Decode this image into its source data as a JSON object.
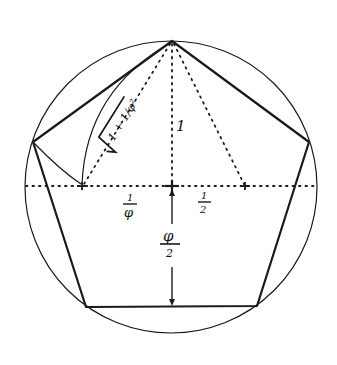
{
  "diagram": {
    "stroke_color": "#1a1a1a",
    "background": "#ffffff",
    "circle": {
      "cx": 171,
      "cy": 187,
      "r": 146
    },
    "pentagon": {
      "vertices": [
        [
          172,
          41
        ],
        [
          309,
          142
        ],
        [
          257,
          306
        ],
        [
          86,
          307
        ],
        [
          33,
          142
        ]
      ]
    },
    "baseline_y": 186,
    "markers": [
      {
        "name": "left-point",
        "x": 82,
        "y": 186
      },
      {
        "name": "center-point",
        "x": 172,
        "y": 186
      },
      {
        "name": "right-point",
        "x": 245,
        "y": 186
      }
    ],
    "labels": {
      "radius": "1",
      "hypotenuse_prefix": "√",
      "hypotenuse_body": "1 + 1/φ²",
      "left_segment_num": "1",
      "left_segment_den": "φ",
      "right_segment_num": "1",
      "right_segment_den": "2",
      "apothem_num": "φ",
      "apothem_den": "2"
    }
  }
}
